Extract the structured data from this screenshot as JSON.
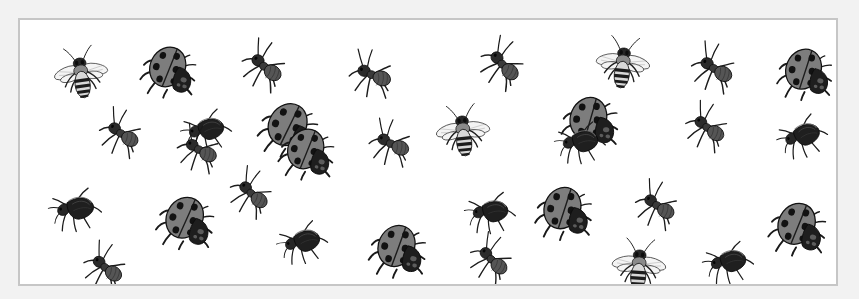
{
  "page": {
    "caption": "",
    "panel_background": "#ffffff",
    "page_background": "#f2f2f2",
    "border_color": "#c6c6c6"
  },
  "legend": {
    "insect_kinds": [
      "bee",
      "ladybug",
      "ant",
      "beetle"
    ],
    "counts": {
      "bee": 4,
      "ladybug": 9,
      "ant": 12,
      "beetle": 7,
      "total": 32
    }
  },
  "palette": {
    "body_dark": "#2b2b2b",
    "body_mid": "#4a4a4a",
    "shell_gray": "#808080",
    "shell_light": "#9a9a9a",
    "wing_light": "#efefef",
    "outline": "#1a1a1a"
  },
  "insects": [
    {
      "name": "bee-1",
      "kind": "bee",
      "x": 30,
      "y": 24,
      "w": 62,
      "h": 58,
      "rot": -8
    },
    {
      "name": "ladybug-1",
      "kind": "ladybug",
      "x": 118,
      "y": 18,
      "w": 66,
      "h": 62,
      "rot": 14
    },
    {
      "name": "ant-1",
      "kind": "ant",
      "x": 214,
      "y": 20,
      "w": 62,
      "h": 56,
      "rot": 25
    },
    {
      "name": "ant-2",
      "kind": "ant",
      "x": 322,
      "y": 28,
      "w": 62,
      "h": 56,
      "rot": 8
    },
    {
      "name": "ant-3",
      "kind": "ant",
      "x": 452,
      "y": 18,
      "w": 62,
      "h": 56,
      "rot": 32
    },
    {
      "name": "bee-2",
      "kind": "bee",
      "x": 572,
      "y": 14,
      "w": 62,
      "h": 58,
      "rot": 6
    },
    {
      "name": "ant-4",
      "kind": "ant",
      "x": 664,
      "y": 22,
      "w": 62,
      "h": 56,
      "rot": 18
    },
    {
      "name": "ladybug-2",
      "kind": "ladybug",
      "x": 754,
      "y": 20,
      "w": 66,
      "h": 62,
      "rot": 10
    },
    {
      "name": "ant-5",
      "kind": "ant",
      "x": 72,
      "y": 88,
      "w": 60,
      "h": 54,
      "rot": 20
    },
    {
      "name": "beetle-1",
      "kind": "beetle",
      "x": 156,
      "y": 84,
      "w": 60,
      "h": 52,
      "rot": -24
    },
    {
      "name": "ladybug-3",
      "kind": "ladybug",
      "x": 236,
      "y": 74,
      "w": 70,
      "h": 66,
      "rot": 18
    },
    {
      "name": "ant-6",
      "kind": "ant",
      "x": 342,
      "y": 98,
      "w": 60,
      "h": 54,
      "rot": 12
    },
    {
      "name": "bee-3",
      "kind": "bee",
      "x": 412,
      "y": 82,
      "w": 62,
      "h": 58,
      "rot": -6
    },
    {
      "name": "ladybug-4",
      "kind": "ladybug",
      "x": 538,
      "y": 68,
      "w": 68,
      "h": 64,
      "rot": 8
    },
    {
      "name": "ant-7",
      "kind": "ant",
      "x": 658,
      "y": 82,
      "w": 60,
      "h": 54,
      "rot": 22
    },
    {
      "name": "beetle-2",
      "kind": "beetle",
      "x": 752,
      "y": 90,
      "w": 60,
      "h": 52,
      "rot": -30
    },
    {
      "name": "beetle-3",
      "kind": "beetle",
      "x": 24,
      "y": 162,
      "w": 62,
      "h": 54,
      "rot": -20
    },
    {
      "name": "ladybug-5",
      "kind": "ladybug",
      "x": 134,
      "y": 168,
      "w": 68,
      "h": 64,
      "rot": 16
    },
    {
      "name": "ant-8",
      "kind": "ant",
      "x": 202,
      "y": 148,
      "w": 60,
      "h": 54,
      "rot": 28
    },
    {
      "name": "beetle-4",
      "kind": "beetle",
      "x": 252,
      "y": 196,
      "w": 60,
      "h": 52,
      "rot": -26
    },
    {
      "name": "ladybug-6",
      "kind": "ladybug",
      "x": 346,
      "y": 196,
      "w": 68,
      "h": 64,
      "rot": 12
    },
    {
      "name": "beetle-5",
      "kind": "beetle",
      "x": 440,
      "y": 166,
      "w": 60,
      "h": 52,
      "rot": -18
    },
    {
      "name": "ladybug-7",
      "kind": "ladybug",
      "x": 512,
      "y": 158,
      "w": 68,
      "h": 64,
      "rot": 10
    },
    {
      "name": "ant-9",
      "kind": "ant",
      "x": 442,
      "y": 214,
      "w": 60,
      "h": 54,
      "rot": 30
    },
    {
      "name": "ant-10",
      "kind": "ant",
      "x": 608,
      "y": 160,
      "w": 60,
      "h": 54,
      "rot": 20
    },
    {
      "name": "bee-4",
      "kind": "bee",
      "x": 588,
      "y": 216,
      "w": 62,
      "h": 58,
      "rot": 4
    },
    {
      "name": "beetle-6",
      "kind": "beetle",
      "x": 678,
      "y": 216,
      "w": 60,
      "h": 52,
      "rot": -22
    },
    {
      "name": "ladybug-8",
      "kind": "ladybug",
      "x": 746,
      "y": 174,
      "w": 68,
      "h": 64,
      "rot": 14
    },
    {
      "name": "ant-11",
      "kind": "ant",
      "x": 56,
      "y": 222,
      "w": 60,
      "h": 54,
      "rot": 24
    },
    {
      "name": "ant-12",
      "kind": "ant",
      "x": 150,
      "y": 104,
      "w": 60,
      "h": 54,
      "rot": 16
    },
    {
      "name": "beetle-7",
      "kind": "beetle",
      "x": 530,
      "y": 96,
      "w": 60,
      "h": 52,
      "rot": -20
    },
    {
      "name": "ladybug-9",
      "kind": "ladybug",
      "x": 256,
      "y": 100,
      "w": 66,
      "h": 62,
      "rot": 14
    }
  ]
}
